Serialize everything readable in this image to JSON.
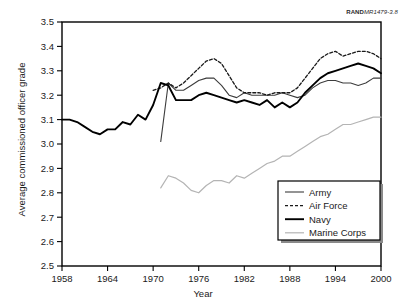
{
  "figure": {
    "source_tag_prefix": "RAND",
    "source_tag_italic": "MR1479-3.8"
  },
  "chart_data": {
    "type": "line",
    "title": "",
    "xlabel": "Year",
    "ylabel": "Average commissioned officer grade",
    "xlim": [
      1958,
      2000
    ],
    "ylim": [
      2.5,
      3.5
    ],
    "xticks": [
      1958,
      1964,
      1970,
      1976,
      1982,
      1988,
      1994,
      2000
    ],
    "yticks": [
      2.5,
      2.6,
      2.7,
      2.8,
      2.9,
      3.0,
      3.1,
      3.2,
      3.3,
      3.4,
      3.5
    ],
    "grid": false,
    "legend_position": "lower-right",
    "series": [
      {
        "name": "Army",
        "style": "solid-thin",
        "color": "#3c3c3c",
        "x": [
          1971,
          1972,
          1973,
          1974,
          1975,
          1976,
          1977,
          1978,
          1979,
          1980,
          1981,
          1982,
          1983,
          1984,
          1985,
          1986,
          1987,
          1988,
          1989,
          1990,
          1991,
          1992,
          1993,
          1994,
          1995,
          1996,
          1997,
          1998,
          1999,
          2000
        ],
        "y": [
          3.01,
          3.25,
          3.22,
          3.22,
          3.24,
          3.26,
          3.27,
          3.27,
          3.24,
          3.2,
          3.19,
          3.21,
          3.2,
          3.2,
          3.2,
          3.2,
          3.21,
          3.2,
          3.19,
          3.2,
          3.23,
          3.25,
          3.26,
          3.26,
          3.25,
          3.25,
          3.24,
          3.25,
          3.27,
          3.27
        ]
      },
      {
        "name": "Air Force",
        "style": "dashed",
        "color": "#1a1a1a",
        "x": [
          1970,
          1971,
          1972,
          1973,
          1974,
          1975,
          1976,
          1977,
          1978,
          1979,
          1980,
          1981,
          1982,
          1983,
          1984,
          1985,
          1986,
          1987,
          1988,
          1989,
          1990,
          1991,
          1992,
          1993,
          1994,
          1995,
          1996,
          1997,
          1998,
          1999,
          2000
        ],
        "y": [
          3.22,
          3.23,
          3.25,
          3.23,
          3.25,
          3.28,
          3.31,
          3.34,
          3.35,
          3.33,
          3.28,
          3.23,
          3.21,
          3.21,
          3.21,
          3.2,
          3.21,
          3.21,
          3.21,
          3.23,
          3.27,
          3.31,
          3.35,
          3.37,
          3.38,
          3.36,
          3.37,
          3.38,
          3.38,
          3.37,
          3.35
        ]
      },
      {
        "name": "Navy",
        "style": "solid-thick",
        "color": "#000000",
        "x": [
          1958,
          1959,
          1960,
          1961,
          1962,
          1963,
          1964,
          1965,
          1966,
          1967,
          1968,
          1969,
          1970,
          1971,
          1972,
          1973,
          1974,
          1975,
          1976,
          1977,
          1978,
          1979,
          1980,
          1981,
          1982,
          1983,
          1984,
          1985,
          1986,
          1987,
          1988,
          1989,
          1990,
          1991,
          1992,
          1993,
          1994,
          1995,
          1996,
          1997,
          1998,
          1999,
          2000
        ],
        "y": [
          3.1,
          3.1,
          3.09,
          3.07,
          3.05,
          3.04,
          3.06,
          3.06,
          3.09,
          3.08,
          3.12,
          3.1,
          3.16,
          3.25,
          3.24,
          3.18,
          3.18,
          3.18,
          3.2,
          3.21,
          3.2,
          3.19,
          3.18,
          3.17,
          3.18,
          3.17,
          3.16,
          3.18,
          3.15,
          3.17,
          3.15,
          3.17,
          3.21,
          3.24,
          3.27,
          3.29,
          3.3,
          3.31,
          3.32,
          3.33,
          3.32,
          3.31,
          3.29
        ]
      },
      {
        "name": "Marine Corps",
        "style": "solid-light",
        "color": "#b4b4b4",
        "x": [
          1971,
          1972,
          1973,
          1974,
          1975,
          1976,
          1977,
          1978,
          1979,
          1980,
          1981,
          1982,
          1983,
          1984,
          1985,
          1986,
          1987,
          1988,
          1989,
          1990,
          1991,
          1992,
          1993,
          1994,
          1995,
          1996,
          1997,
          1998,
          1999,
          2000
        ],
        "y": [
          2.82,
          2.87,
          2.86,
          2.84,
          2.81,
          2.8,
          2.83,
          2.85,
          2.85,
          2.84,
          2.87,
          2.86,
          2.88,
          2.9,
          2.92,
          2.93,
          2.95,
          2.95,
          2.97,
          2.99,
          3.01,
          3.03,
          3.04,
          3.06,
          3.08,
          3.08,
          3.09,
          3.1,
          3.11,
          3.11
        ]
      }
    ]
  },
  "legend": {
    "items": [
      {
        "label": "Army"
      },
      {
        "label": "Air Force"
      },
      {
        "label": "Navy"
      },
      {
        "label": "Marine Corps"
      }
    ]
  }
}
